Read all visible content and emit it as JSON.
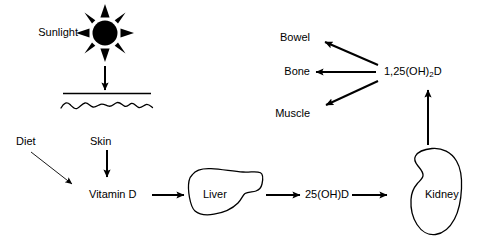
{
  "diagram": {
    "background_color": "#ffffff",
    "stroke_color": "#000000",
    "labels": {
      "sunlight": "Sunlight",
      "diet": "Diet",
      "skin": "Skin",
      "vitamin_d": "Vitamin D",
      "liver": "Liver",
      "kidney": "Kidney",
      "metabolite_25": "25(OH)D",
      "metabolite_125_prefix": "1,25(OH)",
      "metabolite_125_sub": "2",
      "metabolite_125_suffix": "D",
      "bowel": "Bowel",
      "bone": "Bone",
      "muscle": "Muscle"
    },
    "icons": {
      "sun": "sun-icon",
      "skin_surface": "skin-surface-line",
      "skin_wave": "wavy-skin-line",
      "liver_shape": "liver-organ-shape",
      "kidney_shape": "kidney-organ-shape"
    },
    "arrows": [
      {
        "name": "sun-to-skin",
        "style": "thick-solid",
        "direction": "down"
      },
      {
        "name": "diet-to-vitamin-d",
        "style": "thin-solid",
        "direction": "down-right"
      },
      {
        "name": "skin-to-vitamin-d",
        "style": "thick-solid",
        "direction": "down"
      },
      {
        "name": "vitamin-d-to-liver",
        "style": "thick-solid",
        "direction": "right"
      },
      {
        "name": "liver-to-25ohd",
        "style": "thick-solid",
        "direction": "right"
      },
      {
        "name": "25ohd-to-kidney",
        "style": "thick-solid",
        "direction": "right"
      },
      {
        "name": "kidney-to-calcitriol",
        "style": "thick-solid",
        "direction": "up"
      },
      {
        "name": "calcitriol-to-bowel",
        "style": "thick-solid",
        "direction": "up-left"
      },
      {
        "name": "calcitriol-to-bone",
        "style": "thick-solid",
        "direction": "left"
      },
      {
        "name": "calcitriol-to-muscle",
        "style": "thick-solid",
        "direction": "down-left"
      }
    ]
  }
}
